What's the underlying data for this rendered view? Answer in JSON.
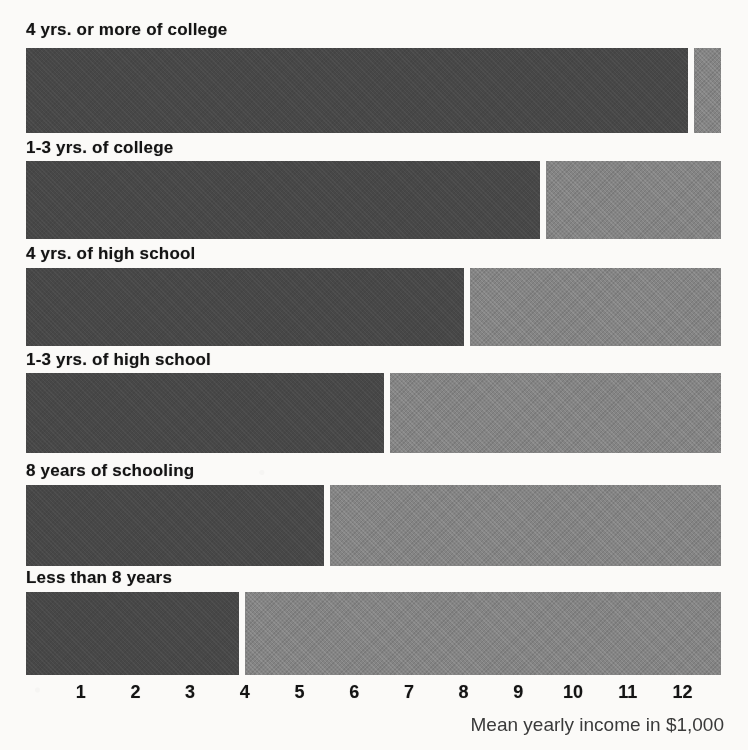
{
  "chart_data": {
    "type": "bar",
    "orientation": "horizontal",
    "stacked": true,
    "title": "",
    "subtitle": "",
    "xlabel": "Mean yearly income in $1,000",
    "ylabel": "",
    "xlim": [
      0,
      12.9
    ],
    "xticks": [
      1,
      2,
      3,
      4,
      5,
      6,
      7,
      8,
      9,
      10,
      11,
      12
    ],
    "xtick_labels": [
      "1",
      "2",
      "3",
      "4",
      "5",
      "6",
      "7",
      "8",
      "9",
      "10",
      "11",
      "12"
    ],
    "grid": false,
    "legend": null,
    "categories": [
      "4 yrs. or more of college",
      "1-3 yrs. of college",
      "4 yrs. of high school",
      "1-3 yrs. of high school",
      "8 years of schooling",
      "Less than 8 years"
    ],
    "series": [
      {
        "name": "dark-segment",
        "color": "#474747",
        "values": [
          12.1,
          9.4,
          8.0,
          6.55,
          5.45,
          3.9
        ]
      },
      {
        "name": "light-segment",
        "color": "#848484",
        "values": [
          0.6,
          3.3,
          4.7,
          6.15,
          7.25,
          8.8
        ]
      }
    ],
    "totals": [
      12.7,
      12.7,
      12.7,
      12.7,
      12.7,
      12.7
    ]
  },
  "axis": {
    "caption": "Mean yearly income in $1,000",
    "ticks": [
      "1",
      "2",
      "3",
      "4",
      "5",
      "6",
      "7",
      "8",
      "9",
      "10",
      "11",
      "12"
    ]
  },
  "bars": [
    {
      "label": "4 yrs. or more of college",
      "dark": 12.1,
      "total": 12.7
    },
    {
      "label": "1-3 yrs. of college",
      "dark": 9.4,
      "total": 12.7
    },
    {
      "label": "4 yrs. of high school",
      "dark": 8.0,
      "total": 12.7
    },
    {
      "label": "1-3 yrs. of high school",
      "dark": 6.55,
      "total": 12.7
    },
    {
      "label": "8 years of schooling",
      "dark": 5.45,
      "total": 12.7
    },
    {
      "label": "Less than 8 years",
      "dark": 3.9,
      "total": 12.7
    }
  ],
  "colors": {
    "dark_segment": "#474747",
    "light_segment": "#848484",
    "paper": "#fbfaf8",
    "text": "#141414"
  }
}
